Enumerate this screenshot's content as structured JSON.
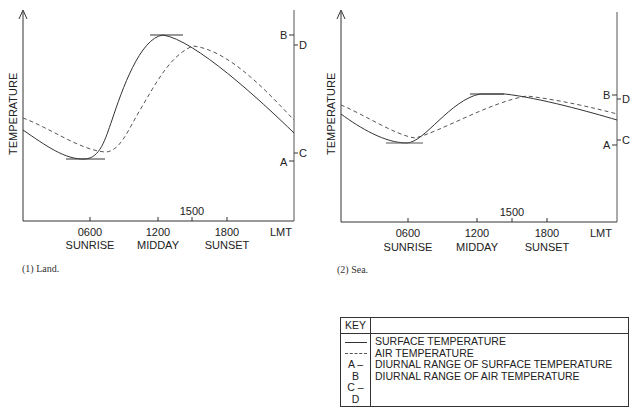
{
  "charts": [
    {
      "id": "land",
      "caption": "(1) Land.",
      "ylabel": "TEMPERATURE",
      "x_ticks": [
        {
          "time": "0600",
          "label": "SUNRISE"
        },
        {
          "time": "1200",
          "label": "MIDDAY"
        },
        {
          "time": "1800",
          "label": "SUNSET"
        }
      ],
      "mid_tick": "1500",
      "x_unit": "LMT",
      "range_marks": {
        "B": "B",
        "D": "D",
        "C": "C",
        "A": "A"
      }
    },
    {
      "id": "sea",
      "caption": "(2) Sea.",
      "ylabel": "TEMPERATURE",
      "x_ticks": [
        {
          "time": "0600",
          "label": "SUNRISE"
        },
        {
          "time": "1200",
          "label": "MIDDAY"
        },
        {
          "time": "1800",
          "label": "SUNSET"
        }
      ],
      "mid_tick": "1500",
      "x_unit": "LMT",
      "range_marks": {
        "B": "B",
        "D": "D",
        "C": "C",
        "A": "A"
      }
    }
  ],
  "key": {
    "title": "KEY",
    "rows": [
      {
        "symbol": "solid-line",
        "text": "SURFACE TEMPERATURE"
      },
      {
        "symbol": "dashed-line",
        "text": "AIR TEMPERATURE"
      },
      {
        "symbol": "A – B",
        "text": "DIURNAL RANGE OF SURFACE TEMPERATURE"
      },
      {
        "symbol": "C – D",
        "text": "DIURNAL RANGE OF AIR TEMPERATURE"
      }
    ]
  }
}
